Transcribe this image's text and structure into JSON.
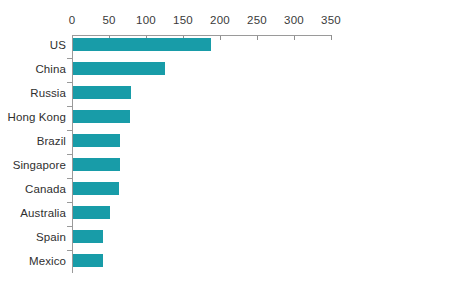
{
  "chart_data": {
    "type": "bar",
    "orientation": "horizontal",
    "title": "",
    "subtitle": "",
    "xlabel": "",
    "ylabel": "",
    "xlim": [
      0,
      350
    ],
    "ylim": null,
    "grid": false,
    "legend": null,
    "legend_position": "none",
    "bar_color": "#189ca8",
    "axis_color": "#9a9a9a",
    "tick_label_color": "#3a3a3a",
    "category_label_color": "#2f2f2f",
    "xticks": [
      0,
      50,
      100,
      150,
      200,
      250,
      300,
      350
    ],
    "xtick_labels": [
      "0",
      "50",
      "100",
      "150",
      "200",
      "250",
      "300",
      "350"
    ],
    "categories": [
      "US",
      "China",
      "Russia",
      "Hong Kong",
      "Brazil",
      "Singapore",
      "Canada",
      "Australia",
      "Spain",
      "Mexico"
    ],
    "values": [
      186,
      124,
      78,
      77,
      64,
      64,
      62,
      50,
      40,
      40
    ],
    "series": [
      {
        "name": "",
        "values": [
          186,
          124,
          78,
          77,
          64,
          64,
          62,
          50,
          40,
          40
        ]
      }
    ]
  },
  "footer": {
    "caption": ""
  }
}
